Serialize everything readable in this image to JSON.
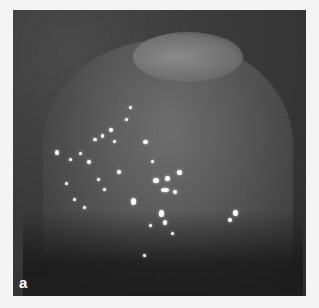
{
  "figure": {
    "panel_label": "a",
    "colors": {
      "background": "#f4f4f4",
      "image_dark": "#1e1e1e",
      "image_mid": "#5c5c5c",
      "label": "#ffffff"
    }
  }
}
